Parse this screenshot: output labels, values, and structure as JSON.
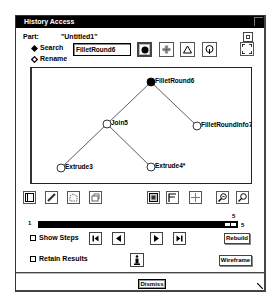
{
  "window": {
    "title": "History Access"
  },
  "part": {
    "label": "Part:",
    "value": "\"Untitled1\""
  },
  "mode": {
    "options": [
      {
        "label": "Search",
        "selected": true
      },
      {
        "label": "Rename",
        "selected": false
      }
    ]
  },
  "search_field": {
    "value": "FilletRound6"
  },
  "shape_buttons": [
    {
      "icon": "filled-circle-icon",
      "selected": true
    },
    {
      "icon": "flower-icon",
      "selected": false
    },
    {
      "icon": "triangle-icon",
      "selected": false
    },
    {
      "icon": "circle-pin-icon",
      "selected": false
    }
  ],
  "tree": {
    "nodes": [
      {
        "id": "FilletRound6",
        "label": "FilletRound6",
        "x": 119,
        "y": 14,
        "filled": true
      },
      {
        "id": "Join5",
        "label": "Join5",
        "x": 75,
        "y": 56,
        "filled": false
      },
      {
        "id": "FilletRoundInfo7",
        "label": "FilletRoundInfo7",
        "x": 165,
        "y": 58,
        "filled": false
      },
      {
        "id": "Extrude3",
        "label": "Extrude3",
        "x": 29,
        "y": 100,
        "filled": false
      },
      {
        "id": "Extrude4",
        "label": "Extrude4*",
        "x": 119,
        "y": 99,
        "filled": false
      }
    ],
    "edges": [
      [
        "FilletRound6",
        "Join5"
      ],
      [
        "FilletRound6",
        "FilletRoundInfo7"
      ],
      [
        "Join5",
        "Extrude3"
      ],
      [
        "Join5",
        "Extrude4"
      ]
    ]
  },
  "toolbar_left": [
    {
      "icon": "select-frame-icon"
    },
    {
      "icon": "pencil-icon"
    },
    {
      "icon": "shape-edit-icon"
    },
    {
      "icon": "copy-icon"
    }
  ],
  "toolbar_right": [
    {
      "icon": "fit-view-icon"
    },
    {
      "icon": "flag-layout-icon"
    },
    {
      "icon": "crosshair-icon"
    },
    {
      "icon": "zoom-in-icon"
    },
    {
      "icon": "zoom-out-icon"
    }
  ],
  "slider": {
    "min": "1",
    "max": "5",
    "current": "5"
  },
  "checkboxes": {
    "show_steps": {
      "label": "Show Steps",
      "checked": false
    },
    "retain_results": {
      "label": "Retain Results",
      "checked": false
    }
  },
  "nav_buttons": [
    {
      "icon": "first-step-icon"
    },
    {
      "icon": "prev-step-icon"
    },
    {
      "icon": "next-step-icon"
    },
    {
      "icon": "last-step-icon"
    }
  ],
  "info_button": {
    "icon": "info-icon"
  },
  "buttons": {
    "rebuild": "Rebuild",
    "wireframe": "Wireframe",
    "dismiss": "Dismiss"
  }
}
